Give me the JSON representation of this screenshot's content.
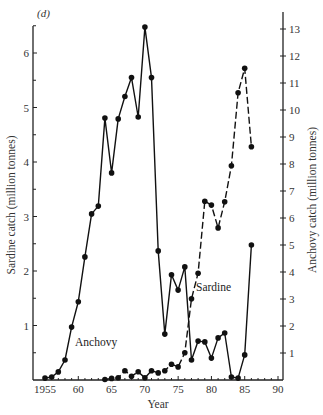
{
  "chart_data": {
    "type": "line",
    "panel_label": "(d)",
    "title": "",
    "xlabel": "Year",
    "ylabel_left": "Sardine catch (million tonnes)",
    "ylabel_right": "Anchovy catch (million tonnes)",
    "xlim": [
      1955,
      1990
    ],
    "ylim_left": [
      0,
      6.5
    ],
    "ylim_right": [
      0,
      13
    ],
    "x_ticks": [
      1955,
      1960,
      1965,
      1970,
      1975,
      1980,
      1985,
      1990
    ],
    "x_tick_labels": [
      "1955",
      "60",
      "65",
      "70",
      "75",
      "80",
      "85",
      "90"
    ],
    "y_left_ticks": [
      1,
      2,
      3,
      4,
      5,
      6
    ],
    "y_left_minor_ticks": [
      0.5,
      1.5,
      2.5,
      3.5,
      4.5,
      5.5,
      6.5
    ],
    "y_right_ticks": [
      1,
      2,
      3,
      4,
      5,
      6,
      7,
      8,
      9,
      10,
      11,
      12,
      13
    ],
    "grid": false,
    "legend": "inline labels",
    "series": [
      {
        "name": "Anchovy",
        "axis": "right",
        "style": "solid",
        "label_text": "Anchovy",
        "x": [
          1955,
          1956,
          1957,
          1958,
          1959,
          1960,
          1961,
          1962,
          1963,
          1964,
          1965,
          1966,
          1967,
          1968,
          1969,
          1970,
          1971,
          1972,
          1973,
          1974,
          1975,
          1976,
          1977,
          1978,
          1979,
          1980,
          1981,
          1982,
          1983,
          1984,
          1985,
          1986
        ],
        "values": [
          0.07,
          0.11,
          0.3,
          0.74,
          1.96,
          2.9,
          4.56,
          6.15,
          6.44,
          9.7,
          7.67,
          9.67,
          10.5,
          11.2,
          9.74,
          13.07,
          11.2,
          4.78,
          1.7,
          3.9,
          3.33,
          4.19,
          0.74,
          1.44,
          1.41,
          0.81,
          1.56,
          1.74,
          0.11,
          0.07,
          0.93,
          5.0
        ]
      },
      {
        "name": "Sardine",
        "axis": "left",
        "style": "dashed",
        "label_text": "Sardine",
        "x": [
          1964,
          1965,
          1966,
          1967,
          1968,
          1969,
          1970,
          1971,
          1972,
          1973,
          1974,
          1975,
          1976,
          1977,
          1978,
          1979,
          1980,
          1981,
          1982,
          1983,
          1984,
          1985,
          1986
        ],
        "values": [
          0.01,
          0.03,
          0.04,
          0.17,
          0.07,
          0.15,
          0.04,
          0.17,
          0.13,
          0.17,
          0.29,
          0.24,
          0.5,
          1.49,
          1.96,
          3.28,
          3.21,
          2.79,
          3.27,
          3.93,
          5.27,
          5.72,
          4.28
        ]
      }
    ]
  },
  "colors": {
    "line": "#111111",
    "axis": "#222222",
    "text": "#333333",
    "background": "#ffffff"
  }
}
